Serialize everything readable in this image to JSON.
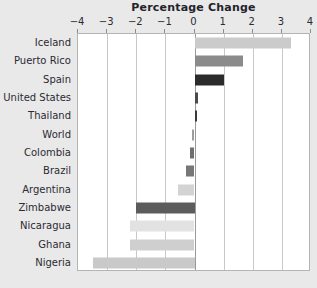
{
  "chart_data": {
    "type": "bar",
    "orientation": "horizontal",
    "title": "Percentage Change",
    "xlabel": "",
    "ylabel": "",
    "xlim": [
      -4,
      4
    ],
    "xticks": [
      -4,
      -3,
      -2,
      -1,
      0,
      1,
      2,
      3,
      4
    ],
    "xtick_labels": [
      "−4",
      "−3",
      "−2",
      "−1",
      "0",
      "1",
      "2",
      "3",
      "4"
    ],
    "grid": true,
    "legend": "none",
    "categories": [
      "Iceland",
      "Puerto Rico",
      "Spain",
      "United States",
      "Thailand",
      "World",
      "Colombia",
      "Brazil",
      "Argentina",
      "Zimbabwe",
      "Nicaragua",
      "Ghana",
      "Nigeria"
    ],
    "values": [
      3.3,
      1.65,
      1.0,
      0.12,
      0.1,
      -0.1,
      -0.15,
      -0.3,
      -0.55,
      -2.0,
      -2.2,
      -2.2,
      -3.5
    ],
    "bar_colors": [
      "#cbcbcb",
      "#8b8b8b",
      "#2b2b2b",
      "#4a4a4a",
      "#3a3a3a",
      "#9d9d9d",
      "#6f6f6f",
      "#777777",
      "#d3d3d3",
      "#5c5c5c",
      "#e2e2e2",
      "#cfcfcf",
      "#c9c9c9"
    ]
  },
  "palette": {
    "background": "#e9e9e9",
    "plot_background": "#ffffff",
    "gridline": "#c8c8c8",
    "zero_line": "#9a9a9a",
    "axis_border": "#b4b4b4",
    "text": "#2b2b33"
  }
}
